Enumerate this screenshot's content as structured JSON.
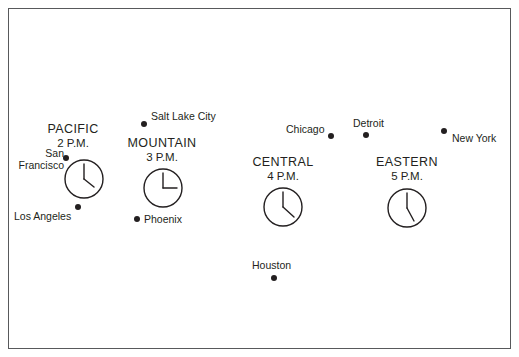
{
  "figure": {
    "kind": "map",
    "border_color": "#58595b",
    "background_color": "#ffffff",
    "land_outline_color": "#231f20",
    "shadow_color": "#bcbec0",
    "lake_fill_color": "#a7a9ac",
    "dashed_boundary_color": "#231f20"
  },
  "zones": [
    {
      "id": "pacific",
      "name": "PACIFIC",
      "time": "2 P.M.",
      "clock_hour": 2,
      "clock_minute": 0,
      "label_x": 58,
      "label_y": 122,
      "clock_cx": 83,
      "clock_cy": 178,
      "clock_r": 20
    },
    {
      "id": "mountain",
      "name": "MOUNTAIN",
      "time": "3 P.M.",
      "clock_hour": 3,
      "clock_minute": 0,
      "label_x": 131,
      "label_y": 136,
      "clock_cx": 162,
      "clock_cy": 187,
      "clock_r": 20
    },
    {
      "id": "central",
      "name": "CENTRAL",
      "time": "4 P.M.",
      "clock_hour": 4,
      "clock_minute": 0,
      "label_x": 254,
      "label_y": 155,
      "clock_cx": 282,
      "clock_cy": 206,
      "clock_r": 20
    },
    {
      "id": "eastern",
      "name": "EASTERN",
      "time": "5 P.M.",
      "clock_hour": 5,
      "clock_minute": 0,
      "label_x": 365,
      "label_y": 155,
      "clock_cx": 406,
      "clock_cy": 207,
      "clock_r": 20
    }
  ],
  "cities": [
    {
      "id": "san-francisco",
      "name": "San\nFrancisco",
      "line1": "San",
      "line2": "Francisco",
      "label_x": 12,
      "label_y": 151,
      "dot_x": 66,
      "dot_y": 158,
      "align": "right"
    },
    {
      "id": "los-angeles",
      "name": "Los Angeles",
      "line1": "Los Angeles",
      "line2": "",
      "label_x": 14,
      "label_y": 211,
      "dot_x": 78,
      "dot_y": 207,
      "align": "right"
    },
    {
      "id": "salt-lake-city",
      "name": "Salt Lake City",
      "line1": "Salt Lake City",
      "line2": "",
      "label_x": 150,
      "label_y": 112,
      "dot_x": 144,
      "dot_y": 124,
      "align": "left"
    },
    {
      "id": "phoenix",
      "name": "Phoenix",
      "line1": "Phoenix",
      "line2": "",
      "label_x": 143,
      "label_y": 215,
      "dot_x": 134,
      "dot_y": 218,
      "align": "left"
    },
    {
      "id": "houston",
      "name": "Houston",
      "line1": "Houston",
      "line2": "",
      "label_x": 251,
      "label_y": 261,
      "dot_x": 274,
      "dot_y": 277,
      "align": "left"
    },
    {
      "id": "chicago",
      "name": "Chicago",
      "line1": "Chicago",
      "line2": "",
      "label_x": 286,
      "label_y": 124,
      "dot_x": 330,
      "dot_y": 136,
      "align": "right"
    },
    {
      "id": "detroit",
      "name": "Detroit",
      "line1": "Detroit",
      "line2": "",
      "label_x": 354,
      "label_y": 119,
      "dot_x": 366,
      "dot_y": 135,
      "align": "left"
    },
    {
      "id": "new-york",
      "name": "New York",
      "line1": "New York",
      "line2": "",
      "label_x": 452,
      "label_y": 133,
      "dot_x": 444,
      "dot_y": 131,
      "align": "left"
    }
  ]
}
